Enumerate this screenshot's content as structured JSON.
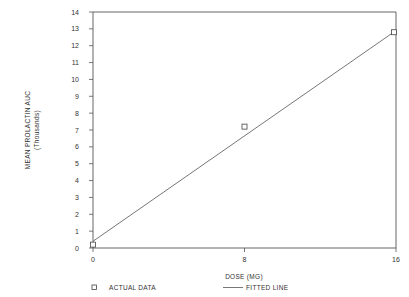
{
  "chart_data": {
    "type": "scatter",
    "title": "",
    "xlabel": "DOSE (MG)",
    "ylabel": "MEAN PROLACTIN AUC",
    "ylabel_sub": "(Thousands)",
    "xlim": [
      0,
      16
    ],
    "ylim": [
      0,
      14
    ],
    "x_ticks": [
      0,
      8,
      16
    ],
    "y_ticks": [
      0,
      1,
      2,
      3,
      4,
      5,
      6,
      7,
      8,
      9,
      10,
      11,
      12,
      13,
      14
    ],
    "grid": false,
    "legend_position": "bottom",
    "series": [
      {
        "name": "ACTUAL DATA",
        "type": "scatter",
        "marker": "open-square",
        "x": [
          0,
          8,
          16
        ],
        "y": [
          0.2,
          7.2,
          12.8
        ]
      },
      {
        "name": "FITTED LINE",
        "type": "line",
        "x": [
          0,
          16
        ],
        "y": [
          0.4,
          12.9
        ]
      }
    ]
  },
  "labels": {
    "ylabel": "MEAN PROLACTIN AUC",
    "ylabel_sub": "(Thousands)",
    "xlabel": "DOSE (MG)",
    "legend_actual": "ACTUAL DATA",
    "legend_fitted": "FITTED LINE",
    "y_ticks": [
      "0",
      "1",
      "2",
      "3",
      "4",
      "5",
      "6",
      "7",
      "8",
      "9",
      "10",
      "11",
      "12",
      "13",
      "14"
    ],
    "x_ticks": [
      "0",
      "8",
      "16"
    ]
  }
}
